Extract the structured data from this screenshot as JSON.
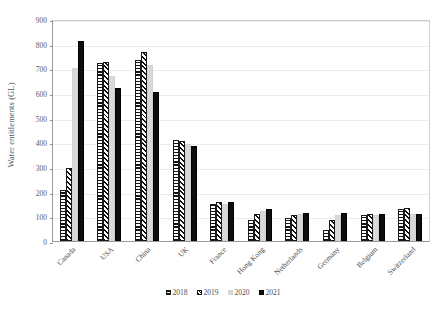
{
  "chart_data": {
    "type": "bar",
    "title": "",
    "xlabel": "",
    "ylabel": "Water entitlements (GL)",
    "ylim": [
      0,
      900
    ],
    "yticks": [
      0,
      100,
      200,
      300,
      400,
      500,
      600,
      700,
      800,
      900
    ],
    "grid": true,
    "legend_position": "bottom",
    "categories": [
      "Canada",
      "USA",
      "China",
      "UK",
      "France",
      "Hong Kong",
      "Netherlands",
      "Germany",
      "Belgium",
      "Switzerland"
    ],
    "series": [
      {
        "name": "2018",
        "pattern": "horizontal-stripes",
        "color": "#111111",
        "values": [
          205,
          720,
          735,
          410,
          150,
          85,
          95,
          45,
          105,
          130
        ]
      },
      {
        "name": "2019",
        "pattern": "diagonal-stripes",
        "color": "#111111",
        "values": [
          295,
          725,
          765,
          405,
          160,
          110,
          105,
          85,
          110,
          135
        ]
      },
      {
        "name": "2020",
        "pattern": "solid-light-gray",
        "color": "#d9d9d9",
        "values": [
          700,
          670,
          715,
          395,
          150,
          120,
          110,
          105,
          105,
          110
        ]
      },
      {
        "name": "2021",
        "pattern": "solid-black",
        "color": "#0d0d0d",
        "values": [
          810,
          620,
          605,
          385,
          160,
          130,
          115,
          115,
          110,
          110
        ]
      }
    ]
  }
}
